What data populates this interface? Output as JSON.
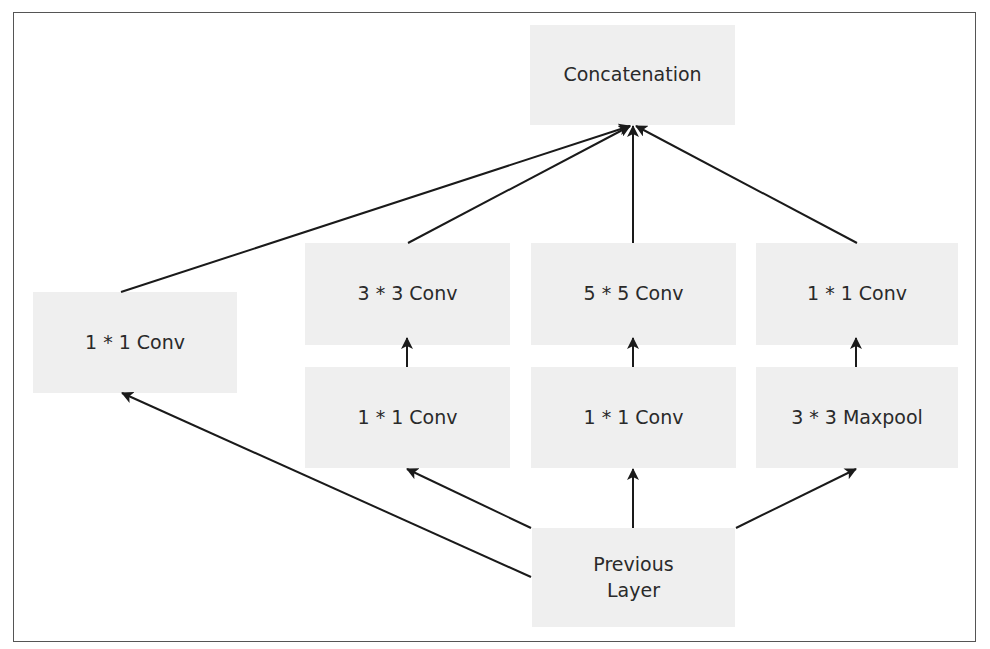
{
  "diagram": {
    "nodes": {
      "concat": "Concatenation",
      "left_conv1": "1 * 1 Conv",
      "conv3": "3 * 3 Conv",
      "conv5": "5 * 5 Conv",
      "pool_conv1": "1 * 1 Conv",
      "reduce3": "1 * 1 Conv",
      "reduce5": "1 * 1 Conv",
      "maxpool": "3 * 3 Maxpool",
      "prev_line1": "Previous",
      "prev_line2": "Layer"
    },
    "edges": [
      [
        "Previous Layer",
        "1 * 1 Conv (left)"
      ],
      [
        "Previous Layer",
        "1 * 1 Conv (3x3 reduce)"
      ],
      [
        "Previous Layer",
        "1 * 1 Conv (5x5 reduce)"
      ],
      [
        "Previous Layer",
        "3 * 3 Maxpool"
      ],
      [
        "1 * 1 Conv (3x3 reduce)",
        "3 * 3 Conv"
      ],
      [
        "1 * 1 Conv (5x5 reduce)",
        "5 * 5 Conv"
      ],
      [
        "3 * 3 Maxpool",
        "1 * 1 Conv (pool proj)"
      ],
      [
        "1 * 1 Conv (left)",
        "Concatenation"
      ],
      [
        "3 * 3 Conv",
        "Concatenation"
      ],
      [
        "5 * 5 Conv",
        "Concatenation"
      ],
      [
        "1 * 1 Conv (pool proj)",
        "Concatenation"
      ]
    ],
    "colors": {
      "box": "#efefef",
      "line": "#1a1a1a",
      "text": "#2a2a2a",
      "border": "#555555"
    }
  }
}
